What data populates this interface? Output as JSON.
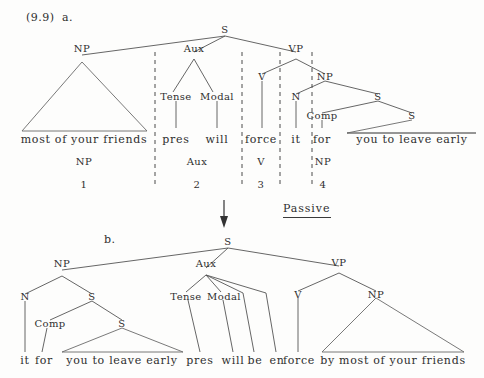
{
  "figure": {
    "example_number": "(9.9)",
    "operation_label": "Passive",
    "subfigures": [
      {
        "id": "a",
        "label": "a."
      },
      {
        "id": "b",
        "label": "b."
      }
    ]
  },
  "tree_a": {
    "nodes": {
      "s_root": "S",
      "np_subject": "NP",
      "aux": "Aux",
      "tense": "Tense",
      "modal": "Modal",
      "vp": "VP",
      "v": "V",
      "np_object": "NP",
      "n": "N",
      "s_embedded": "S",
      "comp": "Comp",
      "s_inner": "S"
    },
    "terminals": [
      {
        "text": "most of your friends"
      },
      {
        "text": "pres"
      },
      {
        "text": "will"
      },
      {
        "text": "force"
      },
      {
        "text": "it"
      },
      {
        "text": "for"
      },
      {
        "text": "you to leave early"
      }
    ],
    "analysis_labels": [
      "NP",
      "Aux",
      "V",
      "NP"
    ],
    "analysis_numbers": [
      "1",
      "2",
      "3",
      "4"
    ]
  },
  "tree_b": {
    "nodes": {
      "s_root": "S",
      "np_subject": "NP",
      "n": "N",
      "s_embedded": "S",
      "comp": "Comp",
      "s_inner": "S",
      "aux": "Aux",
      "tense": "Tense",
      "modal": "Modal",
      "vp": "VP",
      "v": "V",
      "np_object": "NP"
    },
    "terminals": [
      {
        "text": "it"
      },
      {
        "text": "for"
      },
      {
        "text": "you to leave early"
      },
      {
        "text": "pres"
      },
      {
        "text": "will"
      },
      {
        "text": "be"
      },
      {
        "text": "en"
      },
      {
        "text": "force"
      },
      {
        "text": "by most of your friends"
      }
    ]
  },
  "colors": {
    "ink": "#2e2e2e",
    "line": "#555555",
    "paper": "#fdfdfc"
  }
}
